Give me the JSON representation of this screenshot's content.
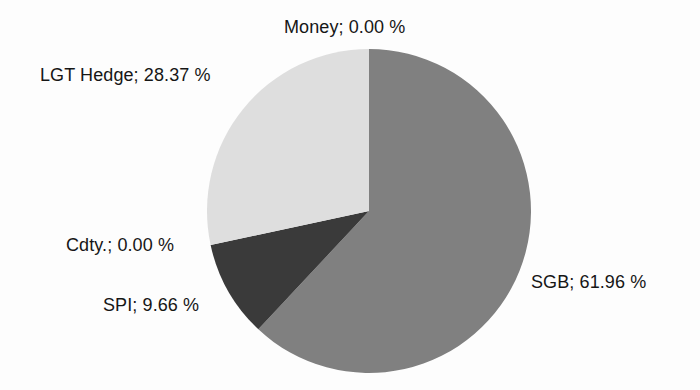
{
  "chart_data": {
    "type": "pie",
    "title": "",
    "categories": [
      "SGB",
      "SPI",
      "Cdty.",
      "LGT Hedge",
      "Money"
    ],
    "values": [
      61.96,
      9.66,
      0.0,
      28.37,
      0.0
    ],
    "value_suffix": "%",
    "start_angle_deg": 0,
    "direction": "clockwise",
    "legend": "none",
    "labels_position": "outside",
    "background": "#fdfdfd",
    "slices": [
      {
        "name": "SGB",
        "label": "SGB; 61.96 %",
        "value": 61.96,
        "color": "#808080",
        "start_deg": 0,
        "end_deg": 223.056
      },
      {
        "name": "SPI",
        "label": "SPI; 9.66 %",
        "value": 9.66,
        "color": "#3a3a3a",
        "start_deg": 223.056,
        "end_deg": 257.832
      },
      {
        "name": "Cdty.",
        "label": "Cdty.; 0.00 %",
        "value": 0.0,
        "color": "#3a3a3a",
        "start_deg": 257.832,
        "end_deg": 257.832
      },
      {
        "name": "LGT Hedge",
        "label": "LGT Hedge; 28.37 %",
        "value": 28.37,
        "color": "#dedede",
        "start_deg": 257.832,
        "end_deg": 360.0
      },
      {
        "name": "Money",
        "label": "Money; 0.00 %",
        "value": 0.0,
        "color": "#dedede",
        "start_deg": 360.0,
        "end_deg": 360.0
      }
    ],
    "geometry": {
      "center_x": 369,
      "center_y": 211,
      "radius": 162
    }
  },
  "labels": {
    "money": "Money; 0.00 %",
    "lgt_hedge": "LGT Hedge; 28.37 %",
    "cdty": "Cdty.; 0.00 %",
    "spi": "SPI; 9.66 %",
    "sgb": "SGB; 61.96 %"
  }
}
